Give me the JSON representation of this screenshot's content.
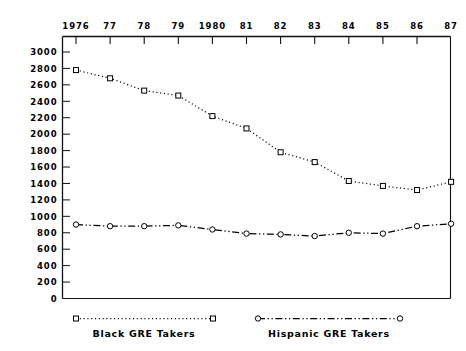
{
  "chart_data": {
    "type": "line",
    "title": "",
    "subtitle": "",
    "xlabel": "",
    "ylabel": "",
    "x_axis_position": "top",
    "grid": false,
    "legend_position": "bottom",
    "categories": [
      "1976",
      "77",
      "78",
      "79",
      "1980",
      "81",
      "82",
      "83",
      "84",
      "85",
      "86",
      "87"
    ],
    "x_tick_labels": [
      "1976",
      "77",
      "78",
      "79",
      "1980",
      "81",
      "82",
      "83",
      "84",
      "85",
      "86",
      "87"
    ],
    "y_tick_labels": [
      "3000",
      "2800",
      "2600",
      "2400",
      "2200",
      "2000",
      "1800",
      "1600",
      "1400",
      "1200",
      "1000",
      "800",
      "600",
      "400",
      "200",
      "0"
    ],
    "ylim": [
      0,
      3000
    ],
    "y_tick_step": 200,
    "series": [
      {
        "name": "Black GRE Takers",
        "marker": "open-square",
        "line_style": "dotted",
        "color": "#000000",
        "values": [
          2780,
          2680,
          2530,
          2470,
          2220,
          2070,
          1780,
          1660,
          1430,
          1370,
          1320,
          1420
        ]
      },
      {
        "name": "Hispanic GRE Takers",
        "marker": "open-circle",
        "line_style": "dash-dot",
        "color": "#000000",
        "values": [
          900,
          880,
          880,
          890,
          840,
          790,
          780,
          760,
          800,
          790,
          880,
          910
        ]
      }
    ],
    "legend": [
      {
        "label": "Black GRE Takers",
        "marker": "open-square",
        "line_style": "dotted"
      },
      {
        "label": "Hispanic GRE Takers",
        "marker": "open-circle",
        "line_style": "dash-dot"
      }
    ]
  }
}
